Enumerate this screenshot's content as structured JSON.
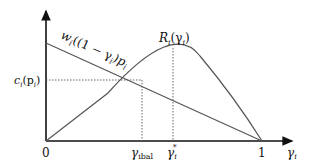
{
  "diagram": {
    "axes": {
      "x_label": "γ",
      "x_label_sub": "i",
      "origin_label": "0",
      "x_end_label": "1"
    },
    "curves": {
      "revenue": {
        "label": "R",
        "label_sub": "i",
        "label_arg": "(γ",
        "label_arg_sub": "i",
        "label_close": ")"
      },
      "wage_line": {
        "label": "w",
        "label_sub": "i",
        "label_rest": "((1 − γ",
        "label_rest_sub": "i",
        "label_rest2": ")p",
        "label_rest2_sub": "i"
      }
    },
    "y_marker": {
      "label": "c",
      "label_sub": "i",
      "label_arg": "(p",
      "label_arg_sub": "i",
      "label_close": ")"
    },
    "x_markers": [
      {
        "label": "γ",
        "sub": "ibal"
      },
      {
        "label": "γ",
        "sub": "i",
        "sup": "*"
      }
    ],
    "colors": {
      "axis": "#111111",
      "curve": "#555555",
      "dotted": "#666666"
    }
  }
}
